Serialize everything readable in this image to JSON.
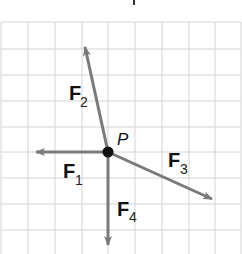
{
  "diagram": {
    "type": "force-vector-diagram",
    "grid": {
      "x_lines": [
        1,
        28,
        55,
        82,
        108,
        135,
        162,
        189,
        215,
        241
      ],
      "y_lines": [
        22,
        49,
        75,
        101,
        127,
        152,
        178,
        204,
        230
      ],
      "color": "#d4d4d4"
    },
    "point": {
      "label": "P",
      "x": 108,
      "y": 152,
      "color": "#111111"
    },
    "arrow_color": "#7a7a7a",
    "vectors": [
      {
        "id": "F1",
        "letter": "F",
        "sub": "1",
        "x2": 36,
        "y2": 152,
        "label_x": 63,
        "label_y": 178,
        "sub_x": 75,
        "sub_y": 185
      },
      {
        "id": "F2",
        "letter": "F",
        "sub": "2",
        "x2": 85,
        "y2": 47,
        "label_x": 69,
        "label_y": 100,
        "sub_x": 80,
        "sub_y": 107
      },
      {
        "id": "F3",
        "letter": "F",
        "sub": "3",
        "x2": 212,
        "y2": 199,
        "label_x": 168,
        "label_y": 167,
        "sub_x": 180,
        "sub_y": 174
      },
      {
        "id": "F4",
        "letter": "F",
        "sub": "4",
        "x2": 108,
        "y2": 245,
        "label_x": 117,
        "label_y": 216,
        "sub_x": 129,
        "sub_y": 222
      }
    ]
  }
}
